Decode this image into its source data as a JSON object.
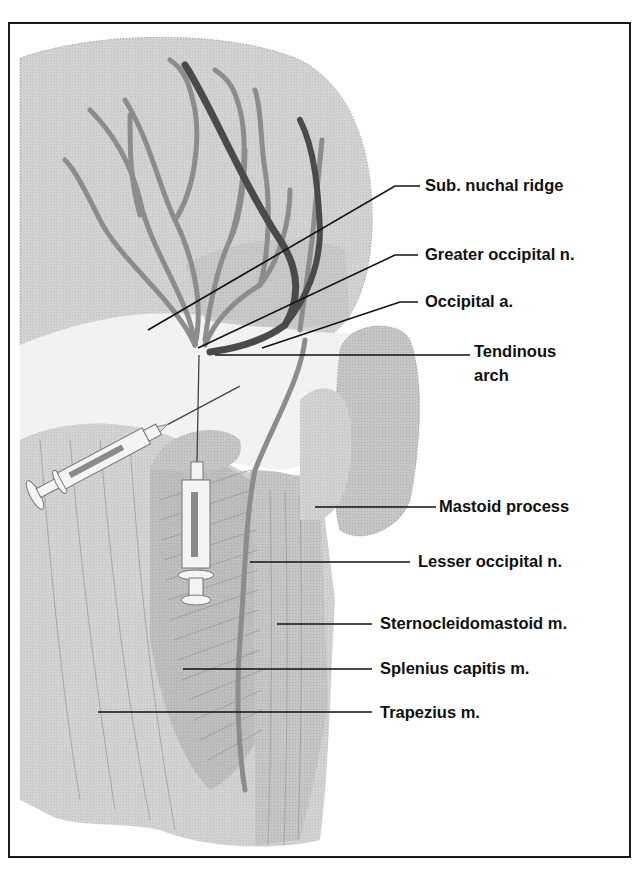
{
  "figure": {
    "type": "anatomical illustration",
    "colors": {
      "frame": "#1a1a1a",
      "skin_light": "#d9d9d9",
      "muscle": "#c4c4c4",
      "muscle_dark": "#b3b3b3",
      "nerve": "#8f8f8f",
      "artery": "#4a4a4a",
      "leader_line": "#111111",
      "label_text": "#111111"
    }
  },
  "labels": [
    {
      "id": "sub-nuchal-ridge",
      "text": "Sub. nuchal ridge",
      "x": 425,
      "y": 176
    },
    {
      "id": "greater-occipital-n",
      "text": "Greater occipital n.",
      "x": 425,
      "y": 245
    },
    {
      "id": "occipital-a",
      "text": "Occipital a.",
      "x": 425,
      "y": 292
    },
    {
      "id": "tendinous-arch-line1",
      "text": "Tendinous",
      "x": 474,
      "y": 342
    },
    {
      "id": "tendinous-arch-line2",
      "text": "arch",
      "x": 474,
      "y": 366
    },
    {
      "id": "mastoid-process",
      "text": "Mastoid process",
      "x": 439,
      "y": 497
    },
    {
      "id": "lesser-occipital-n",
      "text": "Lesser occipital n.",
      "x": 418,
      "y": 552
    },
    {
      "id": "sternocleidomastoid-m",
      "text": "Sternocleidomastoid m.",
      "x": 380,
      "y": 614
    },
    {
      "id": "splenius-capitis-m",
      "text": "Splenius capitis m.",
      "x": 380,
      "y": 659
    },
    {
      "id": "trapezius-m",
      "text": "Trapezius m.",
      "x": 380,
      "y": 703
    }
  ],
  "leaders": [
    {
      "for": "sub-nuchal-ridge",
      "points": "148,330 395,186 420,186"
    },
    {
      "for": "greater-occipital-n",
      "points": "198,348 395,255 418,255"
    },
    {
      "for": "occipital-a",
      "points": "262,348 400,302 418,302"
    },
    {
      "for": "tendinous-arch",
      "points": "215,355 470,355"
    },
    {
      "for": "mastoid-process",
      "points": "315,507 436,507"
    },
    {
      "for": "lesser-occipital-n",
      "points": "250,562 410,562"
    },
    {
      "for": "sternocleidomastoid-m",
      "points": "277,624 372,624"
    },
    {
      "for": "splenius-capitis-m",
      "points": "183,669 372,669"
    },
    {
      "for": "trapezius-m",
      "points": "98,712 372,712"
    }
  ],
  "syringes": [
    {
      "id": "syringe-oblique",
      "orientation": "oblique",
      "target": "greater-occipital-n"
    },
    {
      "id": "syringe-vertical",
      "orientation": "vertical",
      "target": "greater-occipital-n"
    }
  ]
}
